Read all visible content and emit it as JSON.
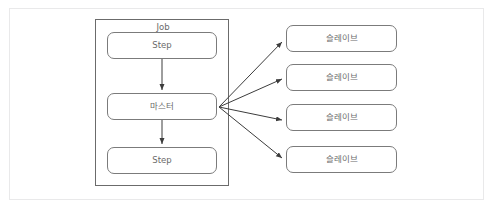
{
  "top_strip": {
    "text": " "
  },
  "diagram": {
    "job": {
      "label": "Job",
      "nodes": [
        {
          "id": "step-top",
          "label": "Step"
        },
        {
          "id": "master",
          "label": "마스터"
        },
        {
          "id": "step-bot",
          "label": "Step"
        }
      ]
    },
    "slaves": [
      {
        "id": "slave-0",
        "label": "슬레이브"
      },
      {
        "id": "slave-1",
        "label": "슬레이브"
      },
      {
        "id": "slave-2",
        "label": "슬레이브"
      },
      {
        "id": "slave-3",
        "label": "슬레이브"
      }
    ],
    "colors": {
      "node_border": "#7b7b7b",
      "job_border": "#6b6b6b",
      "frame_border": "#e9e9ea",
      "text": "#6a6a6a",
      "arrow": "#3c3c3c",
      "background": "#ffffff"
    },
    "edges": [
      {
        "from": "step-top",
        "to": "master",
        "kind": "vertical-arrow"
      },
      {
        "from": "master",
        "to": "step-bot",
        "kind": "vertical-arrow"
      },
      {
        "from": "master",
        "to": "slave-0",
        "kind": "fan-arrow"
      },
      {
        "from": "master",
        "to": "slave-1",
        "kind": "fan-arrow"
      },
      {
        "from": "master",
        "to": "slave-2",
        "kind": "fan-arrow"
      },
      {
        "from": "master",
        "to": "slave-3",
        "kind": "fan-arrow"
      }
    ]
  }
}
